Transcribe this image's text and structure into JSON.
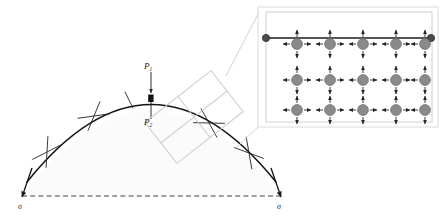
{
  "figure": {
    "type": "technical-diagram"
  },
  "labels": {
    "p1": "P",
    "p1_sub": "1",
    "p2": "P",
    "p2_sub": "2",
    "sigma_left": "σ",
    "sigma_right": "σ"
  },
  "colors": {
    "stroke_dark": "#1a1a1a",
    "arc_stroke": "#141414",
    "callout_gray": "#c9c9c9",
    "inset_border": "#d0d0d0",
    "atom_fill": "#8a8a8a",
    "atom_stroke": "#6f6f6f",
    "node_fill": "#4a4a4a",
    "dome_fill": "#fbfbfb",
    "dashed_line": "#2a2a2a"
  },
  "arc": {
    "left_end": [
      22,
      196
    ],
    "right_end": [
      281,
      196
    ],
    "apex": [
      151,
      98
    ],
    "tick_count": 5,
    "tick_marker": "x-cross"
  },
  "baseline": {
    "style": "dashed",
    "from": [
      22,
      196
    ],
    "to": [
      281,
      196
    ]
  },
  "load_arrows": {
    "p1_direction": "down",
    "p2_direction": "down",
    "apex_marker": "filled-bar"
  },
  "callout_patch": {
    "shape": "rotated-quad-grid",
    "rows": 2,
    "cols": 2
  },
  "inset": {
    "lattice_rows": 3,
    "lattice_cols": 5,
    "arrows_per_atom": 4,
    "arrow_directions": [
      "up",
      "down",
      "left",
      "right"
    ],
    "top_bar": {
      "endpoint_nodes": 2,
      "style": "solid-line-with-round-ends"
    }
  }
}
